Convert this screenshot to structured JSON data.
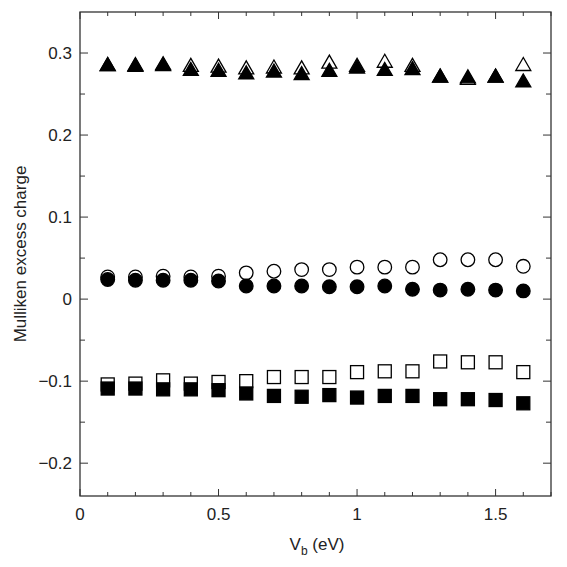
{
  "chart_data": {
    "type": "scatter",
    "title": "",
    "xlabel": "V_b (eV)",
    "xlabel_main": "V",
    "xlabel_sub": "b",
    "xlabel_unit": " (eV)",
    "ylabel": "Mulliken excess charge",
    "xlim": [
      0,
      1.7
    ],
    "ylim": [
      -0.24,
      0.35
    ],
    "grid": false,
    "legend": null,
    "x_ticks": [
      0,
      0.5,
      1,
      1.5
    ],
    "x_tick_labels": [
      "0",
      "0.5",
      "1",
      "1.5"
    ],
    "x_minor_step": 0.1,
    "y_ticks": [
      -0.2,
      -0.1,
      0,
      0.1,
      0.2,
      0.3
    ],
    "y_tick_labels": [
      "−0.2",
      "−0.1",
      "0",
      "0.1",
      "0.2",
      "0.3"
    ],
    "y_minor_step": 0.05,
    "x": [
      0.1,
      0.2,
      0.3,
      0.4,
      0.5,
      0.6,
      0.7,
      0.8,
      0.9,
      1.0,
      1.1,
      1.2,
      1.3,
      1.4,
      1.5,
      1.6
    ],
    "series": [
      {
        "name": "triangle-open",
        "marker": "triangle",
        "filled": false,
        "values": [
          0.285,
          0.285,
          0.286,
          0.284,
          0.283,
          0.281,
          0.282,
          0.281,
          0.288,
          0.284,
          0.289,
          0.284,
          0.271,
          0.268,
          0.271,
          0.285
        ]
      },
      {
        "name": "triangle-filled",
        "marker": "triangle",
        "filled": true,
        "values": [
          0.285,
          0.284,
          0.285,
          0.279,
          0.278,
          0.275,
          0.277,
          0.274,
          0.278,
          0.282,
          0.279,
          0.28,
          0.271,
          0.27,
          0.271,
          0.265
        ]
      },
      {
        "name": "circle-open",
        "marker": "circle",
        "filled": false,
        "values": [
          0.027,
          0.027,
          0.028,
          0.027,
          0.028,
          0.032,
          0.034,
          0.036,
          0.036,
          0.039,
          0.039,
          0.039,
          0.048,
          0.048,
          0.048,
          0.04
        ]
      },
      {
        "name": "circle-filled",
        "marker": "circle",
        "filled": true,
        "values": [
          0.024,
          0.023,
          0.023,
          0.023,
          0.022,
          0.016,
          0.016,
          0.016,
          0.015,
          0.015,
          0.016,
          0.012,
          0.011,
          0.012,
          0.011,
          0.01
        ]
      },
      {
        "name": "square-open",
        "marker": "square",
        "filled": false,
        "values": [
          -0.104,
          -0.103,
          -0.099,
          -0.103,
          -0.101,
          -0.1,
          -0.095,
          -0.095,
          -0.095,
          -0.089,
          -0.088,
          -0.088,
          -0.076,
          -0.077,
          -0.077,
          -0.089
        ]
      },
      {
        "name": "square-filled",
        "marker": "square",
        "filled": true,
        "values": [
          -0.109,
          -0.109,
          -0.11,
          -0.11,
          -0.111,
          -0.115,
          -0.118,
          -0.119,
          -0.117,
          -0.12,
          -0.118,
          -0.118,
          -0.122,
          -0.122,
          -0.123,
          -0.127
        ]
      }
    ]
  }
}
